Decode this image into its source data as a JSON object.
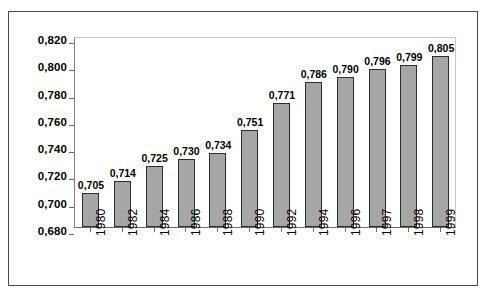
{
  "chart_data": {
    "type": "bar",
    "title": "",
    "xlabel": "",
    "ylabel": "",
    "categories": [
      "1980",
      "1982",
      "1984",
      "1986",
      "1988",
      "1990",
      "1992",
      "1994",
      "1996",
      "1997",
      "1998",
      "1999"
    ],
    "values": [
      0.705,
      0.714,
      0.725,
      0.73,
      0.734,
      0.751,
      0.771,
      0.786,
      0.79,
      0.796,
      0.799,
      0.805
    ],
    "value_labels": [
      "0,705",
      "0,714",
      "0,725",
      "0,730",
      "0,734",
      "0,751",
      "0,771",
      "0,786",
      "0,790",
      "0,796",
      "0,799",
      "0,805"
    ],
    "ylim": [
      0.68,
      0.82
    ],
    "ytick_values": [
      0.82,
      0.8,
      0.78,
      0.76,
      0.74,
      0.72,
      0.7,
      0.68
    ],
    "ytick_labels": [
      "0,820",
      "0,800",
      "0,780",
      "0,760",
      "0,740",
      "0,720",
      "0,700",
      "0,680"
    ],
    "decimal_separator": ",",
    "grid": false,
    "legend": null,
    "bar_color": "#a6a6a6",
    "bar_border_color": "#2d2d2d",
    "axis_color": "#6b6b6b",
    "text_color": "#000000",
    "background": "#ffffff",
    "xtick_rotation": 90
  }
}
